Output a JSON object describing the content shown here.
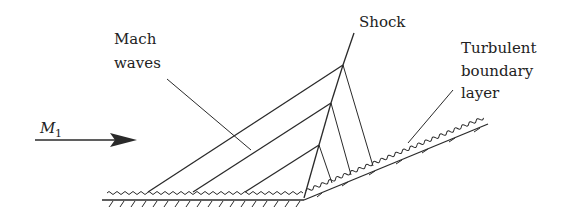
{
  "figure": {
    "type": "compression corner flow diagram",
    "labels": {
      "shock": "Shock",
      "mach_waves_line1": "Mach",
      "mach_waves_line2": "waves",
      "boundary_layer_line1": "Turbulent",
      "boundary_layer_line2": "boundary",
      "boundary_layer_line3": "layer",
      "freestream_symbol": "M",
      "freestream_subscript": "1"
    },
    "colors": {
      "line": "#2a2a2a",
      "text": "#222222",
      "background": "#ffffff"
    }
  }
}
